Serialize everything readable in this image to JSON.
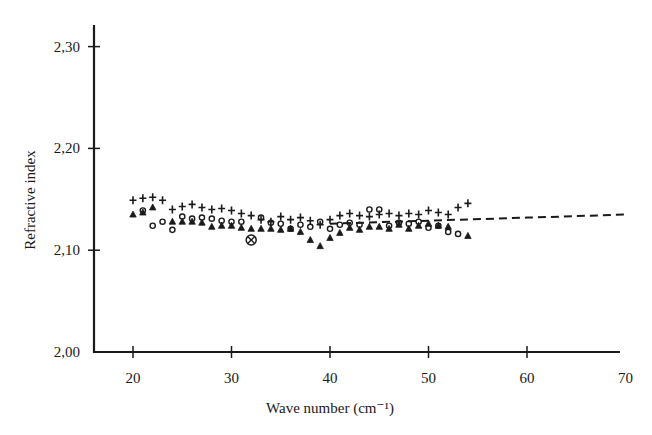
{
  "chart_data": {
    "type": "scatter",
    "title": "",
    "xlabel": "Wave number (cm⁻¹)",
    "ylabel": "Refractive index",
    "xlim": [
      16,
      70
    ],
    "ylim": [
      2.0,
      2.32
    ],
    "x_ticks": [
      20,
      30,
      40,
      50,
      60,
      70
    ],
    "x_tick_labels": [
      "20",
      "30",
      "40",
      "50",
      "60",
      "70"
    ],
    "y_ticks": [
      2.0,
      2.1,
      2.2,
      2.3
    ],
    "y_tick_labels": [
      "2,00",
      "2,10",
      "2,20",
      "2,30"
    ],
    "grid": false,
    "legend": null,
    "series": [
      {
        "name": "plus",
        "marker": "+",
        "points": [
          [
            20,
            2.149
          ],
          [
            21,
            2.151
          ],
          [
            22,
            2.152
          ],
          [
            23,
            2.149
          ],
          [
            24,
            2.14
          ],
          [
            25,
            2.143
          ],
          [
            26,
            2.145
          ],
          [
            27,
            2.142
          ],
          [
            28,
            2.14
          ],
          [
            29,
            2.141
          ],
          [
            30,
            2.139
          ],
          [
            31,
            2.136
          ],
          [
            32,
            2.134
          ],
          [
            33,
            2.13
          ],
          [
            34,
            2.128
          ],
          [
            35,
            2.133
          ],
          [
            36,
            2.13
          ],
          [
            37,
            2.132
          ],
          [
            38,
            2.129
          ],
          [
            39,
            2.125
          ],
          [
            40,
            2.13
          ],
          [
            41,
            2.134
          ],
          [
            42,
            2.136
          ],
          [
            43,
            2.134
          ],
          [
            44,
            2.133
          ],
          [
            45,
            2.135
          ],
          [
            46,
            2.136
          ],
          [
            47,
            2.134
          ],
          [
            48,
            2.136
          ],
          [
            49,
            2.135
          ],
          [
            50,
            2.139
          ],
          [
            51,
            2.137
          ],
          [
            52,
            2.135
          ],
          [
            53,
            2.142
          ],
          [
            54,
            2.146
          ]
        ]
      },
      {
        "name": "circle",
        "marker": "o",
        "points": [
          [
            21,
            2.139
          ],
          [
            22,
            2.124
          ],
          [
            23,
            2.128
          ],
          [
            24,
            2.12
          ],
          [
            25,
            2.133
          ],
          [
            26,
            2.131
          ],
          [
            27,
            2.132
          ],
          [
            28,
            2.131
          ],
          [
            29,
            2.129
          ],
          [
            30,
            2.128
          ],
          [
            31,
            2.128
          ],
          [
            33,
            2.132
          ],
          [
            34,
            2.127
          ],
          [
            35,
            2.126
          ],
          [
            36,
            2.121
          ],
          [
            37,
            2.125
          ],
          [
            38,
            2.123
          ],
          [
            39,
            2.128
          ],
          [
            40,
            2.121
          ],
          [
            41,
            2.125
          ],
          [
            42,
            2.127
          ],
          [
            43,
            2.125
          ],
          [
            44,
            2.14
          ],
          [
            45,
            2.14
          ],
          [
            46,
            2.124
          ],
          [
            47,
            2.127
          ],
          [
            48,
            2.126
          ],
          [
            49,
            2.128
          ],
          [
            50,
            2.122
          ],
          [
            51,
            2.124
          ],
          [
            52,
            2.118
          ],
          [
            53,
            2.116
          ]
        ]
      },
      {
        "name": "triangle",
        "marker": "^",
        "points": [
          [
            20,
            2.135
          ],
          [
            21,
            2.137
          ],
          [
            22,
            2.142
          ],
          [
            24,
            2.128
          ],
          [
            25,
            2.128
          ],
          [
            26,
            2.128
          ],
          [
            27,
            2.127
          ],
          [
            28,
            2.123
          ],
          [
            29,
            2.124
          ],
          [
            30,
            2.124
          ],
          [
            31,
            2.122
          ],
          [
            32,
            2.121
          ],
          [
            33,
            2.121
          ],
          [
            34,
            2.121
          ],
          [
            35,
            2.12
          ],
          [
            36,
            2.121
          ],
          [
            37,
            2.118
          ],
          [
            38,
            2.11
          ],
          [
            39,
            2.104
          ],
          [
            40,
            2.112
          ],
          [
            41,
            2.117
          ],
          [
            42,
            2.122
          ],
          [
            43,
            2.12
          ],
          [
            44,
            2.123
          ],
          [
            45,
            2.123
          ],
          [
            46,
            2.121
          ],
          [
            47,
            2.125
          ],
          [
            48,
            2.121
          ],
          [
            49,
            2.124
          ],
          [
            50,
            2.126
          ],
          [
            51,
            2.124
          ],
          [
            52,
            2.123
          ],
          [
            54,
            2.114
          ]
        ]
      },
      {
        "name": "circled-cross",
        "marker": "⊗",
        "points": [
          [
            32,
            2.11
          ]
        ]
      },
      {
        "name": "dashed-fit",
        "style": "dashed-line",
        "points": [
          [
            40,
            2.126
          ],
          [
            50,
            2.129
          ],
          [
            60,
            2.132
          ],
          [
            70,
            2.135
          ]
        ]
      }
    ]
  },
  "axes": {
    "x_title": "Wave number (cm⁻¹)",
    "y_title": "Refractive index"
  },
  "colors": {
    "ink": "#1a1a1a",
    "background": "#ffffff"
  }
}
